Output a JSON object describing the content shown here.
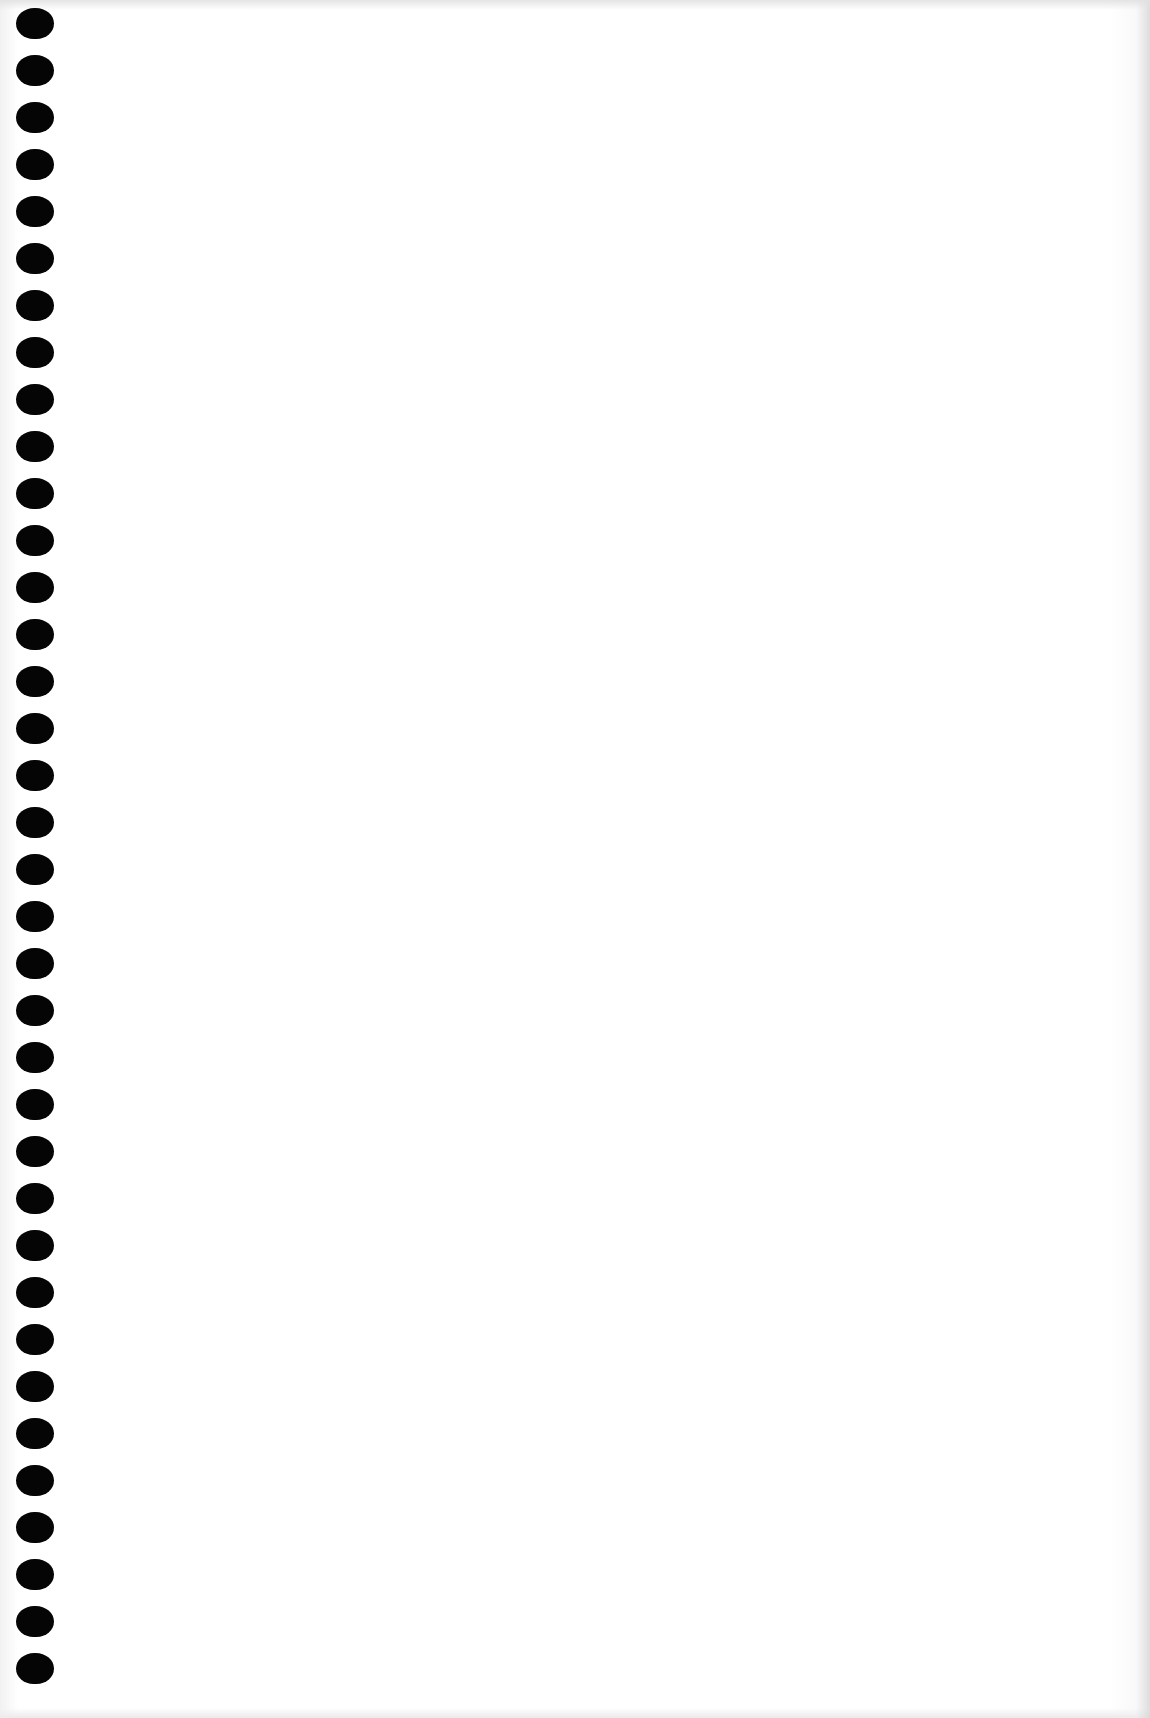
{
  "page": {
    "type": "blank-spiral-notebook-page",
    "background_color": "#ffffff",
    "hole_color": "#050505",
    "hole_count": 36,
    "hole_spacing_px": 47,
    "first_hole_top_px": 8,
    "content_text": ""
  }
}
